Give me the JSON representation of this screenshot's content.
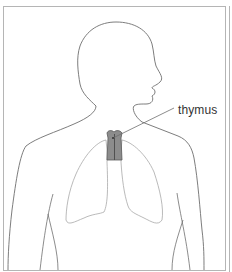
{
  "diagram": {
    "type": "anatomical illustration",
    "labels": [
      {
        "id": "thymus",
        "text": "thymus",
        "x": 178,
        "y": 103
      }
    ],
    "colors": {
      "outline": "#6e6e6e",
      "lung_outline": "#a8a8a8",
      "thymus_fill": "#8c8c8c",
      "thymus_outline": "#5a5a5a",
      "frame": "#b5b5b5",
      "text": "#333333"
    }
  }
}
